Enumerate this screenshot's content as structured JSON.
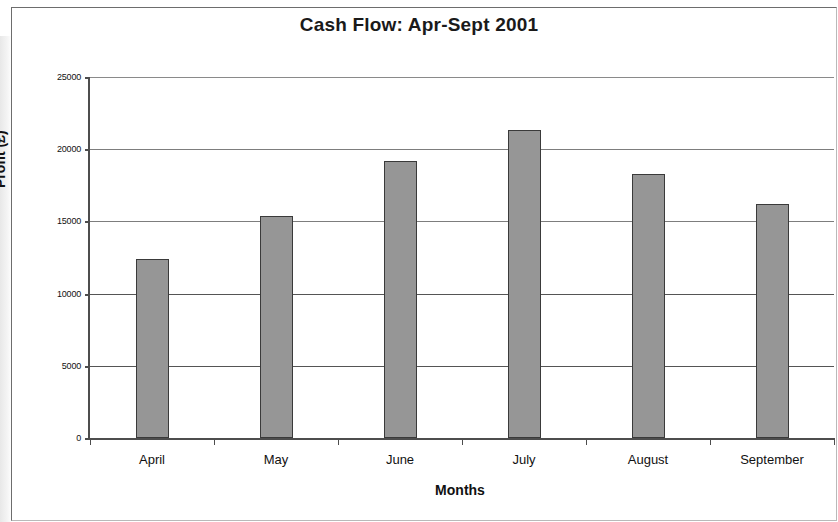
{
  "chart_data": {
    "type": "bar",
    "title": "Cash Flow: Apr-Sept 2001",
    "xlabel": "Months",
    "ylabel": "Profit (£)",
    "categories": [
      "April",
      "May",
      "June",
      "July",
      "August",
      "September"
    ],
    "values": [
      12400,
      15400,
      19200,
      21300,
      18300,
      16200
    ],
    "ylim": [
      0,
      25000
    ],
    "ytick_labels": [
      "0",
      "5000",
      "10000",
      "15000",
      "20000",
      "25000"
    ],
    "ytick_values": [
      0,
      5000,
      10000,
      15000,
      20000,
      25000
    ],
    "grid": true,
    "legend": false,
    "bar_color": "#969696",
    "bar_edge_color": "#3a3a3a",
    "axis_color": "#4d4d4d",
    "background": "#ffffff"
  }
}
